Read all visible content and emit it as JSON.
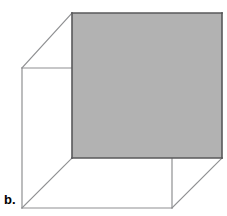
{
  "figure": {
    "label": "b.",
    "kind": "cube-line-drawing",
    "canvas": {
      "width": 227,
      "height": 216,
      "background": "#ffffff"
    },
    "style": {
      "shaded_face_fill": "#b2b2b2",
      "shaded_edge_color": "#58585a",
      "shaded_edge_width": 1.6,
      "wireframe_edge_color": "#8f9092",
      "wireframe_edge_width": 1.2,
      "label_color": "#000000"
    },
    "projection": {
      "note": "oblique projection; depth offset applied to near square to produce far square",
      "depth_offset_x": 50,
      "depth_offset_y": -55
    },
    "vertices": {
      "near_top_left": {
        "x": 22,
        "y": 68
      },
      "near_top_right": {
        "x": 172,
        "y": 68
      },
      "near_bottom_right": {
        "x": 172,
        "y": 208
      },
      "near_bottom_left": {
        "x": 22,
        "y": 208
      },
      "far_top_left": {
        "x": 72,
        "y": 13
      },
      "far_top_right": {
        "x": 222,
        "y": 13
      },
      "far_bottom_right": {
        "x": 222,
        "y": 158
      },
      "far_bottom_left": {
        "x": 72,
        "y": 158
      }
    },
    "faces": [
      {
        "name": "far-square-face",
        "shaded": true,
        "fill": "#b2b2b2",
        "points": "72,13 222,13 222,158 72,158"
      }
    ],
    "edges": [
      {
        "name": "near-square-top",
        "shaded": false,
        "points": "22,68 172,68"
      },
      {
        "name": "near-square-right",
        "shaded": false,
        "points": "172,68 172,208"
      },
      {
        "name": "near-square-bottom",
        "shaded": false,
        "points": "172,208 22,208"
      },
      {
        "name": "near-square-left",
        "shaded": false,
        "points": "22,208 22,68"
      },
      {
        "name": "connector-top-left",
        "shaded": false,
        "points": "22,68 72,13"
      },
      {
        "name": "connector-top-right",
        "shaded": false,
        "points": "172,68 222,13"
      },
      {
        "name": "connector-bottom-right",
        "shaded": false,
        "points": "172,208 222,158"
      },
      {
        "name": "connector-bottom-left",
        "shaded": false,
        "points": "22,208 72,158"
      },
      {
        "name": "far-square-top",
        "shaded": true,
        "points": "72,13 222,13"
      },
      {
        "name": "far-square-right",
        "shaded": true,
        "points": "222,13 222,158"
      },
      {
        "name": "far-square-bottom",
        "shaded": true,
        "points": "222,158 72,158"
      },
      {
        "name": "far-square-left",
        "shaded": true,
        "points": "72,158 72,13"
      }
    ]
  }
}
